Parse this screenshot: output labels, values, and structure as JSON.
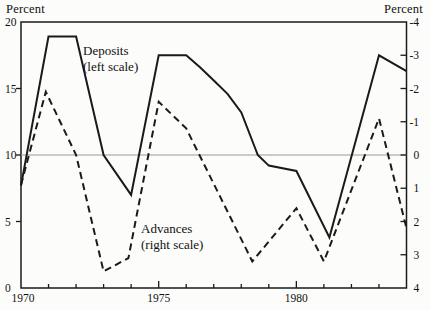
{
  "chart_data": {
    "type": "line",
    "title": "",
    "left_axis": {
      "label": "Percent",
      "range": [
        0,
        20
      ],
      "ticks": [
        0,
        5,
        10,
        15,
        20
      ]
    },
    "right_axis": {
      "label": "Percent",
      "range": [
        4,
        -4
      ],
      "inverted": true,
      "ticks": [
        -4,
        -3,
        -2,
        -1,
        0,
        1,
        2,
        3,
        4
      ]
    },
    "x_axis": {
      "range": [
        1970,
        1984
      ],
      "tick_interval": 1,
      "labeled_ticks": [
        1970,
        1975,
        1980
      ],
      "major_ticks": [
        1975,
        1980
      ]
    },
    "zero_line_left_value": 10,
    "grid": "off",
    "ink_color": "#1a1a1a",
    "zero_line_color": "#999999",
    "series": [
      {
        "name": "Deposits",
        "scale": "left",
        "style": "solid",
        "annotation_line1": "Deposits",
        "annotation_line2": "(left scale)",
        "points": [
          [
            1970,
            7.7
          ],
          [
            1971,
            18.9
          ],
          [
            1972,
            18.9
          ],
          [
            1973,
            10.0
          ],
          [
            1974,
            7.0
          ],
          [
            1975,
            17.5
          ],
          [
            1976,
            17.5
          ],
          [
            1976.5,
            16.6
          ],
          [
            1977,
            15.6
          ],
          [
            1977.5,
            14.6
          ],
          [
            1978,
            13.2
          ],
          [
            1978.6,
            10.0
          ],
          [
            1979,
            9.2
          ],
          [
            1980,
            8.8
          ],
          [
            1981.2,
            3.8
          ],
          [
            1983,
            17.5
          ],
          [
            1984,
            16.3
          ]
        ]
      },
      {
        "name": "Advances",
        "scale": "right",
        "style": "dashed",
        "annotation_line1": "Advances",
        "annotation_line2": "(right scale)",
        "points": [
          [
            1970,
            0.9
          ],
          [
            1970.9,
            -1.9
          ],
          [
            1972,
            0.0
          ],
          [
            1973,
            3.5
          ],
          [
            1973.9,
            3.1
          ],
          [
            1975,
            -1.6
          ],
          [
            1976,
            -0.8
          ],
          [
            1978.4,
            3.2
          ],
          [
            1980,
            1.6
          ],
          [
            1981,
            3.2
          ],
          [
            1983,
            -1.1
          ],
          [
            1984,
            2.2
          ]
        ]
      }
    ]
  }
}
